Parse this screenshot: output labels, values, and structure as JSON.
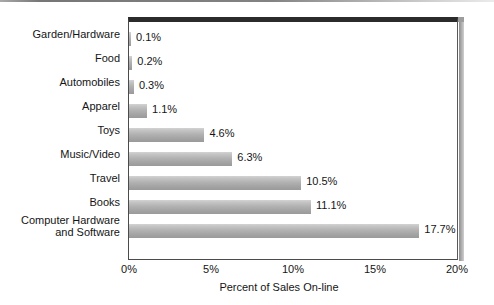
{
  "chart_data": {
    "type": "bar",
    "orientation": "horizontal",
    "title": "",
    "xlabel": "Percent of Sales On-line",
    "ylabel": "",
    "xlim": [
      0,
      20
    ],
    "xticks": [
      "0%",
      "5%",
      "10%",
      "15%",
      "20%"
    ],
    "xtick_values": [
      0,
      5,
      10,
      15,
      20
    ],
    "grid": false,
    "legend": null,
    "value_label_suffix": "%",
    "categories": [
      "Garden/Hardware",
      "Food",
      "Automobiles",
      "Apparel",
      "Toys",
      "Music/Video",
      "Travel",
      "Books",
      "Computer Hardware\nand Software"
    ],
    "values": [
      0.1,
      0.2,
      0.3,
      1.1,
      4.6,
      6.3,
      10.5,
      11.1,
      17.7
    ],
    "value_labels": [
      "0.1%",
      "0.2%",
      "0.3%",
      "1.1%",
      "4.6%",
      "6.3%",
      "10.5%",
      "11.1%",
      "17.7%"
    ],
    "bar_color": "#b0b0b0",
    "frame_color": "#2b2b2b",
    "background_color": "#ffffff"
  }
}
